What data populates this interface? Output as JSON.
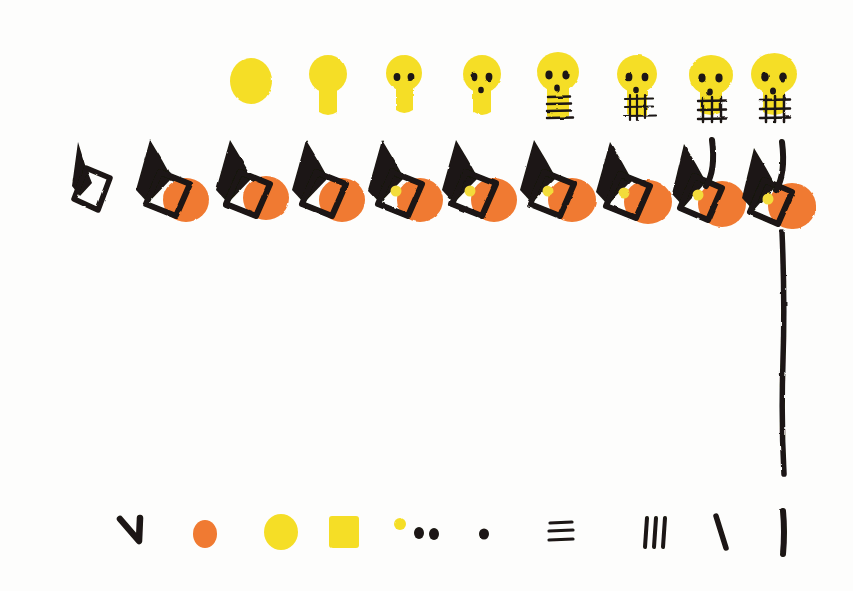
{
  "artwork": {
    "title": "Hand-drawn progressive skull and gnome figure sequence",
    "background_color": "#fdfdfc",
    "width": 853,
    "height": 591,
    "palette": {
      "yellow": "#F5DE28",
      "yellow_soft": "#F3DC3A",
      "orange": "#F07A30",
      "black": "#1a1512",
      "white": "#ffffff"
    }
  },
  "skull_row": {
    "label": "Top row: yellow skull construction sequence",
    "count": 8,
    "baseline_y": 60,
    "items": [
      {
        "name": "skull-blob",
        "x": 251,
        "stage": "plain oval blob",
        "features": [],
        "cx": 251,
        "cy": 81,
        "rx": 21,
        "ry": 22,
        "has_neck": false
      },
      {
        "name": "skull-head-neck",
        "x": 328,
        "stage": "head with neck",
        "features": [
          "neck"
        ],
        "cx": 328,
        "cy": 76,
        "rx": 19,
        "ry": 19,
        "has_neck": true
      },
      {
        "name": "skull-eyes",
        "x": 404,
        "stage": "two eyes added",
        "features": [
          "neck",
          "eyes"
        ],
        "cx": 404,
        "cy": 75,
        "rx": 18,
        "ry": 18,
        "has_neck": true
      },
      {
        "name": "skull-eyes-nose",
        "x": 482,
        "stage": "eyes plus nose",
        "features": [
          "neck",
          "eyes",
          "nose"
        ],
        "cx": 482,
        "cy": 76,
        "rx": 19,
        "ry": 19,
        "has_neck": true
      },
      {
        "name": "skull-teeth-lines",
        "x": 558,
        "stage": "horizontal teeth lines",
        "features": [
          "neck",
          "eyes",
          "nose",
          "teeth_horizontal"
        ],
        "cx": 558,
        "cy": 74,
        "rx": 21,
        "ry": 20,
        "has_neck": true
      },
      {
        "name": "skull-teeth-grid-small",
        "x": 637,
        "stage": "teeth grid with verticals",
        "features": [
          "neck",
          "eyes",
          "nose",
          "teeth_grid"
        ],
        "cx": 637,
        "cy": 76,
        "rx": 20,
        "ry": 19,
        "has_neck": true
      },
      {
        "name": "skull-teeth-grid-wide",
        "x": 711,
        "stage": "wider teeth grid",
        "features": [
          "neck",
          "eyes",
          "nose",
          "teeth_grid"
        ],
        "cx": 711,
        "cy": 77,
        "rx": 22,
        "ry": 20,
        "has_neck": true
      },
      {
        "name": "skull-complete",
        "x": 774,
        "stage": "complete skull",
        "features": [
          "neck",
          "eyes",
          "nose",
          "teeth_grid"
        ],
        "cx": 774,
        "cy": 76,
        "rx": 23,
        "ry": 21,
        "has_neck": true
      }
    ]
  },
  "figure_row": {
    "label": "Middle row: gnome figure construction sequence",
    "count": 10,
    "items": [
      {
        "name": "figure-hat-only",
        "x": 85,
        "stage": "black hat with white diamond",
        "has_face": false,
        "has_yellow_dot": false,
        "has_stroke": false,
        "scale": 0.72
      },
      {
        "name": "figure-hat-face",
        "x": 160,
        "stage": "hat plus orange face",
        "has_face": true,
        "has_yellow_dot": false,
        "has_stroke": false,
        "scale": 1.0
      },
      {
        "name": "figure-hat-face-2",
        "x": 240,
        "stage": "hat plus orange face",
        "has_face": true,
        "has_yellow_dot": false,
        "has_stroke": false,
        "scale": 1.0
      },
      {
        "name": "figure-hat-face-3",
        "x": 316,
        "stage": "hat plus orange face",
        "has_face": true,
        "has_yellow_dot": false,
        "has_stroke": false,
        "scale": 1.0
      },
      {
        "name": "figure-yellow-dot-1",
        "x": 392,
        "stage": "yellow dot added in diamond",
        "has_face": true,
        "has_yellow_dot": true,
        "has_stroke": false,
        "scale": 1.0
      },
      {
        "name": "figure-yellow-dot-2",
        "x": 466,
        "stage": "yellow dot added in diamond",
        "has_face": true,
        "has_yellow_dot": true,
        "has_stroke": false,
        "scale": 1.0
      },
      {
        "name": "figure-yellow-dot-3",
        "x": 545,
        "stage": "yellow dot added in diamond",
        "has_face": true,
        "has_yellow_dot": true,
        "has_stroke": false,
        "scale": 1.0
      },
      {
        "name": "figure-yellow-dot-4",
        "x": 620,
        "stage": "yellow dot added in diamond",
        "has_face": true,
        "has_yellow_dot": true,
        "has_stroke": false,
        "scale": 1.0
      },
      {
        "name": "figure-with-stroke",
        "x": 694,
        "stage": "vertical stroke added",
        "has_face": true,
        "has_yellow_dot": true,
        "has_stroke": true,
        "scale": 1.0
      },
      {
        "name": "figure-with-long-line",
        "x": 764,
        "stage": "long vertical line drawn below",
        "has_face": true,
        "has_yellow_dot": true,
        "has_stroke": true,
        "has_long_line": true,
        "scale": 1.0
      }
    ],
    "long_line": {
      "name": "long-vertical-line",
      "x": 783,
      "y_start": 230,
      "y_end": 475
    }
  },
  "legend_row": {
    "label": "Bottom row: individual drawing elements legend",
    "count": 10,
    "baseline_y": 534,
    "items": [
      {
        "name": "legend-checkmark-stroke",
        "x": 135,
        "type": "angled stroke",
        "color": "#1a1512"
      },
      {
        "name": "legend-orange-dot",
        "x": 205,
        "type": "orange oval",
        "color": "#F07A30"
      },
      {
        "name": "legend-yellow-circle",
        "x": 281,
        "type": "yellow circle",
        "color": "#F5DE28"
      },
      {
        "name": "legend-yellow-square",
        "x": 344,
        "type": "yellow square",
        "color": "#F5DE28"
      },
      {
        "name": "legend-small-yellow-dot",
        "x": 400,
        "type": "small yellow dot",
        "color": "#F5DE28"
      },
      {
        "name": "legend-two-black-dots",
        "x": 426,
        "type": "pair of black dots",
        "color": "#1a1512"
      },
      {
        "name": "legend-single-black-dot",
        "x": 484,
        "type": "single black dot",
        "color": "#1a1512"
      },
      {
        "name": "legend-horizontal-lines",
        "x": 560,
        "type": "stacked horizontal lines",
        "color": "#1a1512"
      },
      {
        "name": "legend-tally-marks",
        "x": 655,
        "type": "three vertical tally marks",
        "color": "#1a1512"
      },
      {
        "name": "legend-diagonal-stroke",
        "x": 722,
        "type": "short diagonal stroke",
        "color": "#1a1512"
      },
      {
        "name": "legend-vertical-stroke",
        "x": 783,
        "type": "long vertical stroke",
        "color": "#1a1512"
      }
    ]
  }
}
